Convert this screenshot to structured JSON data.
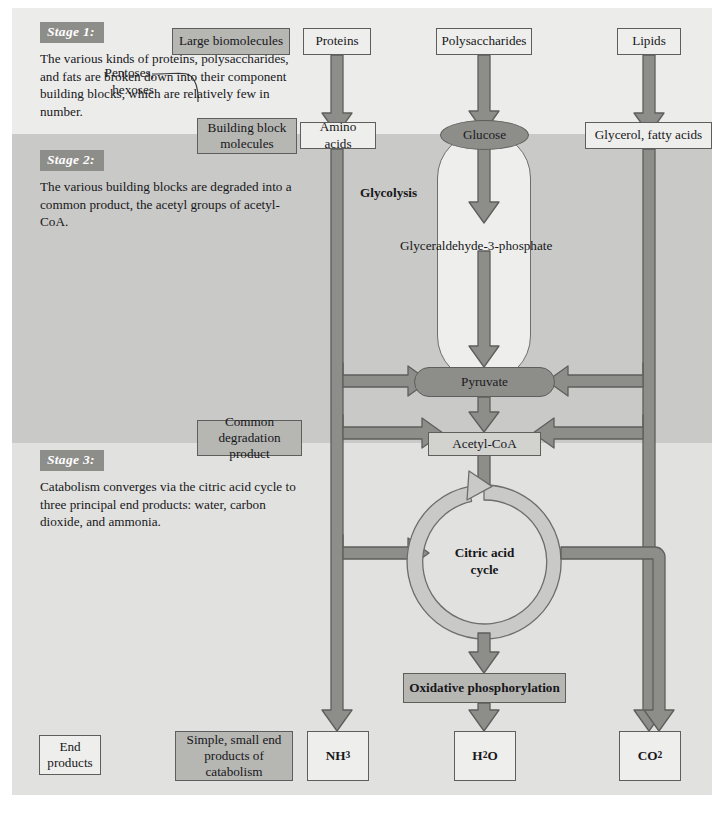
{
  "figure": {
    "accent_dark": "#8d8d8a",
    "accent_arrow": "#8d8d8a",
    "band1_color": "#ececeb",
    "band2_color": "#c9c9c7",
    "band3_color": "#e1e1df"
  },
  "stages": [
    {
      "label": "Stage 1:",
      "text": "The various kinds of proteins, polysaccharides, and fats are broken down into their component building blocks, which are relatively few in number."
    },
    {
      "label": "Stage 2:",
      "text": "The various building blocks are degraded into a common product, the acetyl groups of acetyl-CoA."
    },
    {
      "label": "Stage 3:",
      "text": "Catabolism converges via the citric acid cycle to three principal end products: water, carbon dioxide, and ammonia."
    }
  ],
  "legend_boxes": [
    {
      "id": "large-biomolecules",
      "text": "Large biomolecules"
    },
    {
      "id": "building-block-molecules",
      "text": "Building block molecules"
    },
    {
      "id": "common-degradation-product",
      "text": "Common degradation product"
    },
    {
      "id": "end-products",
      "text": "End products"
    },
    {
      "id": "simple-small-end-products",
      "text": "Simple, small end products of catabolism"
    }
  ],
  "nodes": {
    "proteins": "Proteins",
    "polysaccharides": "Polysaccharides",
    "lipids": "Lipids",
    "amino_acids": "Amino acids",
    "glucose": "Glucose",
    "glycerol_fatty_acids": "Glycerol, fatty acids",
    "pyruvate": "Pyruvate",
    "acetyl_coa": "Acetyl-CoA",
    "oxidative_phosphorylation": "Oxidative phosphorylation",
    "citric_acid_cycle_line1": "Citric acid",
    "citric_acid_cycle_line2": "cycle"
  },
  "annotations": {
    "pentoses_hexoses_line1": "Pentoses,",
    "pentoses_hexoses_line2": "hexoses",
    "glycolysis": "Glycolysis",
    "g3p": "Glyceraldehyde-3-phosphate"
  },
  "end_products": [
    {
      "id": "ammonia",
      "formula": "NH",
      "subscript": "3"
    },
    {
      "id": "water",
      "formula": "H",
      "subscript": "2",
      "suffix": "O"
    },
    {
      "id": "carbon-dioxide",
      "formula": "CO",
      "subscript": "2"
    }
  ]
}
